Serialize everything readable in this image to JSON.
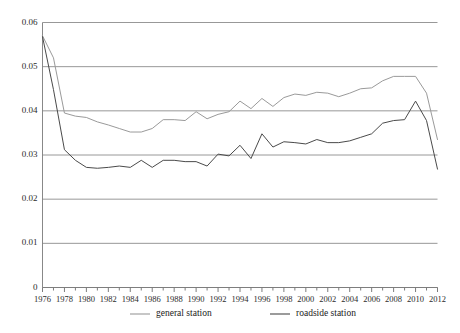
{
  "chart_data": {
    "type": "line",
    "title": "",
    "subtitle": "",
    "xlabel": "",
    "ylabel": "",
    "x": [
      1976,
      1977,
      1978,
      1979,
      1980,
      1981,
      1982,
      1983,
      1984,
      1985,
      1986,
      1987,
      1988,
      1989,
      1990,
      1991,
      1992,
      1993,
      1994,
      1995,
      1996,
      1997,
      1998,
      1999,
      2000,
      2001,
      2002,
      2003,
      2004,
      2005,
      2006,
      2007,
      2008,
      2009,
      2010,
      2011,
      2012
    ],
    "xlim": [
      1976,
      2012
    ],
    "ylim": [
      0,
      0.06
    ],
    "yticks": [
      0,
      0.01,
      0.02,
      0.03,
      0.04,
      0.05,
      0.06
    ],
    "ytick_labels": [
      "0",
      "0.01",
      "0.02",
      "0.03",
      "0.04",
      "0.05",
      "0.06"
    ],
    "xtick_labels": [
      "1976",
      "1978",
      "1980",
      "1982",
      "1984",
      "1986",
      "1988",
      "1990",
      "1992",
      "1994",
      "1996",
      "1998",
      "2000",
      "2002",
      "2004",
      "2006",
      "2008",
      "2010",
      "2012"
    ],
    "xtick_step": 2,
    "xminor_step": 1,
    "grid": true,
    "grid_axis": "y",
    "legend_position": "bottom",
    "series": [
      {
        "name": "general station",
        "color": "#9a9a9a",
        "values": [
          0.057,
          0.052,
          0.0395,
          0.0388,
          0.0385,
          0.0375,
          0.0368,
          0.036,
          0.0352,
          0.0352,
          0.036,
          0.038,
          0.038,
          0.0378,
          0.0398,
          0.0382,
          0.0392,
          0.0398,
          0.0422,
          0.0405,
          0.0428,
          0.041,
          0.043,
          0.0438,
          0.0435,
          0.0442,
          0.044,
          0.0432,
          0.044,
          0.045,
          0.0452,
          0.0468,
          0.0478,
          0.0478,
          0.0478,
          0.044,
          0.0335
        ]
      },
      {
        "name": "roadside station",
        "color": "#4a4a4a",
        "values": [
          0.0568,
          0.0448,
          0.0312,
          0.0288,
          0.0272,
          0.027,
          0.0272,
          0.0275,
          0.0272,
          0.0288,
          0.0272,
          0.0288,
          0.0288,
          0.0285,
          0.0285,
          0.0275,
          0.0302,
          0.0298,
          0.0322,
          0.0292,
          0.0348,
          0.0318,
          0.033,
          0.0328,
          0.0325,
          0.0335,
          0.0328,
          0.0328,
          0.0332,
          0.034,
          0.0348,
          0.0372,
          0.0378,
          0.038,
          0.0422,
          0.0378,
          0.0268
        ]
      }
    ]
  },
  "legend": {
    "items": [
      {
        "label": "general station",
        "color": "#9a9a9a"
      },
      {
        "label": "roadside station",
        "color": "#4a4a4a"
      }
    ]
  },
  "colors": {
    "grid": "#8c8c8c",
    "axis": "#7a7a7a",
    "text": "#1a1a1a",
    "background": "#ffffff"
  }
}
